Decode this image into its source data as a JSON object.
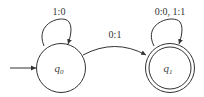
{
  "diagram": {
    "type": "finite-state-transducer",
    "states": [
      {
        "id": "q0",
        "name": "q",
        "sub": "0",
        "initial": true,
        "accepting": false
      },
      {
        "id": "q1",
        "name": "q",
        "sub": "1",
        "initial": false,
        "accepting": true
      }
    ],
    "transitions": [
      {
        "from": "q0",
        "to": "q0",
        "label": "1:0"
      },
      {
        "from": "q0",
        "to": "q1",
        "label": "0:1"
      },
      {
        "from": "q1",
        "to": "q1",
        "label": "0:0, 1:1"
      }
    ]
  }
}
